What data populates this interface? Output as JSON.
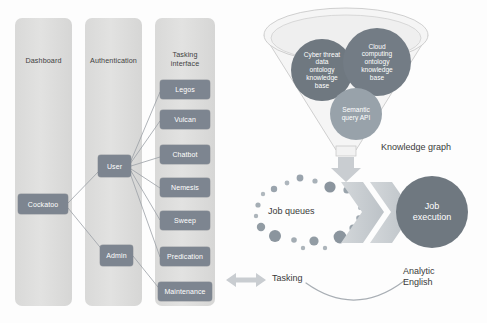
{
  "diagram": {
    "colors": {
      "column_fill": "#dededd",
      "node_fill": "#7d8590",
      "node_text": "#ffffff",
      "dark_circle": "#6f7880",
      "mid_circle": "#8f9aa3",
      "light_circle": "#a7b0b8",
      "funnel_fill": "#f2f2f2",
      "funnel_stroke": "#bdbdbd",
      "chevron_fill": "#c9cdd1",
      "arrow_fill": "#c9cdd1",
      "line_stroke": "#9aa0a6",
      "label_text": "#3a3a3a"
    },
    "columns": [
      {
        "id": "dashboard",
        "label": "Dashboard",
        "nodes": [
          {
            "id": "cockatoo",
            "label": "Cockatoo"
          }
        ]
      },
      {
        "id": "authentication",
        "label": "Authentication",
        "nodes": [
          {
            "id": "user",
            "label": "User"
          },
          {
            "id": "admin",
            "label": "Admin"
          }
        ]
      },
      {
        "id": "tasking-interface",
        "label": "Tasking\ninterface",
        "label_line1": "Tasking",
        "label_line2": "interface",
        "nodes": [
          {
            "id": "legos",
            "label": "Legos"
          },
          {
            "id": "vulcan",
            "label": "Vulcan"
          },
          {
            "id": "chatbot",
            "label": "Chatbot"
          },
          {
            "id": "nemesis",
            "label": "Nemesis"
          },
          {
            "id": "sweep",
            "label": "Sweep"
          },
          {
            "id": "predication",
            "label": "Predication"
          },
          {
            "id": "maintenance",
            "label": "Maintenance"
          }
        ]
      }
    ],
    "knowledge_graph": {
      "caption": "Knowledge graph",
      "circles": [
        {
          "id": "cyber-threat-kb",
          "label": "Cyber threat data ontology knowledge base",
          "lines": [
            "Cyber threat",
            "data",
            "ontology",
            "knowledge",
            "base"
          ]
        },
        {
          "id": "cloud-computing-kb",
          "label": "Cloud computing ontology knowledge base",
          "lines": [
            "Cloud",
            "computing",
            "ontology",
            "knowledge",
            "base"
          ]
        },
        {
          "id": "semantic-query-api",
          "label": "Semantic query API",
          "lines": [
            "Semantic",
            "query API"
          ]
        }
      ]
    },
    "pipeline": {
      "job_queues_label": "Job queues",
      "job_execution": {
        "line1": "Job",
        "line2": "execution",
        "label": "Job execution"
      },
      "tasking_label": "Tasking",
      "analytic_english": {
        "line1": "Analytic",
        "line2": "English",
        "label": "Analytic English"
      }
    }
  }
}
